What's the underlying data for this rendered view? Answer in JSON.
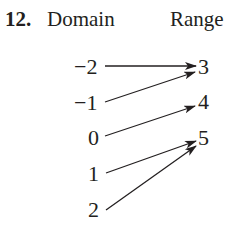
{
  "problem": {
    "number": "12.",
    "domain_heading": "Domain",
    "range_heading": "Range"
  },
  "domain": [
    "−2",
    "−1",
    "0",
    "1",
    "2"
  ],
  "range": [
    "3",
    "4",
    "5"
  ],
  "mapping": [
    {
      "from": "−2",
      "to": "3"
    },
    {
      "from": "−1",
      "to": "3"
    },
    {
      "from": "0",
      "to": "4"
    },
    {
      "from": "1",
      "to": "5"
    },
    {
      "from": "2",
      "to": "5"
    }
  ],
  "colors": {
    "ink": "#231f20",
    "background": "#ffffff"
  }
}
